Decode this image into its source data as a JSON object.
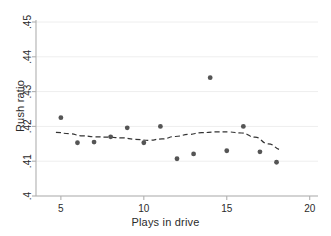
{
  "chart_data": {
    "type": "scatter",
    "title": "",
    "xlabel": "Plays in drive",
    "ylabel": "Rush ratio",
    "xlim": [
      3.5,
      20.5
    ],
    "ylim": [
      0.4,
      0.45
    ],
    "xticks": [
      5,
      10,
      15,
      20
    ],
    "xtick_labels": [
      "5",
      "10",
      "15",
      "20"
    ],
    "yticks": [
      0.4,
      0.41,
      0.42,
      0.43,
      0.44,
      0.45
    ],
    "ytick_labels": [
      ".4",
      ".41",
      ".42",
      ".43",
      ".44",
      ".45"
    ],
    "grid": "horizontal",
    "legend": "none",
    "marker_color": "#555555",
    "line_color": "#333333",
    "grid_color": "#eeeeee",
    "axis_color": "#b0b0b0",
    "series": [
      {
        "name": "Rush ratio by plays in drive",
        "style": "scatter",
        "x": [
          5,
          6,
          7,
          8,
          9,
          10,
          11,
          12,
          13,
          14,
          15,
          16,
          17,
          18
        ],
        "y": [
          0.4225,
          0.4153,
          0.4155,
          0.417,
          0.4196,
          0.4153,
          0.42,
          0.4107,
          0.4121,
          0.434,
          0.413,
          0.42,
          0.4127,
          0.4097
        ]
      },
      {
        "name": "Smoothed fit (lowess)",
        "style": "dashed-line",
        "x": [
          4.7,
          5.5,
          6.3,
          7.1,
          7.9,
          8.7,
          9.5,
          10.3,
          11.1,
          11.9,
          12.7,
          13.5,
          14.3,
          15.1,
          15.9,
          16.7,
          17.5,
          18.3
        ],
        "y": [
          0.4183,
          0.4179,
          0.4173,
          0.417,
          0.4169,
          0.4167,
          0.4163,
          0.416,
          0.4164,
          0.4171,
          0.4177,
          0.4182,
          0.4184,
          0.4184,
          0.4181,
          0.4169,
          0.415,
          0.4133
        ]
      }
    ]
  }
}
